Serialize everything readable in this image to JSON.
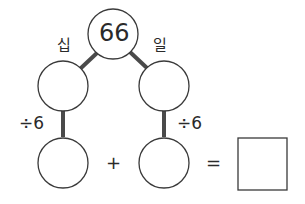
{
  "diagram": {
    "top_value": "66",
    "left_branch_label": "십",
    "right_branch_label": "일",
    "left_operation": "÷6",
    "right_operation": "÷6",
    "plus_sign": "+",
    "equals_sign": "=",
    "left_mid_value": "",
    "right_mid_value": "",
    "left_bottom_value": "",
    "right_bottom_value": "",
    "result_value": ""
  },
  "colors": {
    "stroke": "#3a3a3a",
    "connector": "#4a4a4a",
    "background": "#ffffff"
  }
}
